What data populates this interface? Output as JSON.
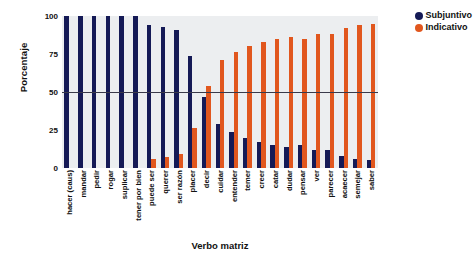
{
  "chart_data": {
    "type": "bar",
    "title": "",
    "xlabel": "Verbo matriz",
    "ylabel": "Porcentaje",
    "ylim": [
      0,
      100
    ],
    "yticks": [
      0,
      25,
      50,
      75,
      100
    ],
    "grid": false,
    "legend_position": "top-right",
    "reference_line": 50,
    "categories": [
      "hacer (caus)",
      "mandar",
      "pedir",
      "rogar",
      "suplicar",
      "tener por bien",
      "puede ser",
      "querer",
      "ser razón",
      "placer",
      "decir",
      "cuidar",
      "entender",
      "temer",
      "creer",
      "catar",
      "dudar",
      "pensar",
      "ver",
      "parecer",
      "acaecer",
      "semejar",
      "saber"
    ],
    "series": [
      {
        "name": "Subjuntivo",
        "color": "#151a56",
        "values": [
          100,
          100,
          100,
          100,
          100,
          100,
          94,
          93,
          91,
          74,
          47,
          29,
          24,
          20,
          17,
          15,
          14,
          15,
          12,
          12,
          8,
          6,
          5
        ]
      },
      {
        "name": "Indicativo",
        "color": "#E1571E",
        "values": [
          0,
          0,
          0,
          0,
          0,
          0,
          6,
          7,
          9,
          26,
          54,
          71,
          76,
          80,
          83,
          85,
          86,
          85,
          88,
          88,
          92,
          94,
          95
        ]
      }
    ]
  }
}
